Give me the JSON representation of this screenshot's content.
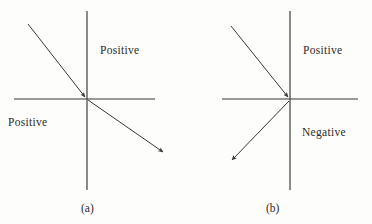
{
  "figure": {
    "type": "diagram",
    "background_color": "#fdfdfc",
    "line_color": "#3a3734",
    "text_color": "#2e2b29"
  },
  "panels": [
    {
      "id": "a",
      "caption": "(a)",
      "origin": {
        "x": 87,
        "y": 99
      },
      "axes": {
        "horizontal": {
          "x1": 14,
          "y1": 99,
          "x2": 155,
          "y2": 99
        },
        "vertical": {
          "x1": 87,
          "y1": 11,
          "x2": 87,
          "y2": 190
        }
      },
      "rays": [
        {
          "name": "incident-ray",
          "from": {
            "x": 28,
            "y": 24
          },
          "to": {
            "x": 85,
            "y": 97
          },
          "arrowhead_at": "end",
          "quadrant_start": "upper-left",
          "quadrant_end": "origin"
        },
        {
          "name": "outgoing-ray",
          "from": {
            "x": 88,
            "y": 100
          },
          "to": {
            "x": 163,
            "y": 152
          },
          "arrowhead_at": "end",
          "quadrant_start": "origin",
          "quadrant_end": "lower-right"
        }
      ],
      "labels": [
        {
          "name": "label-upper-right",
          "text": "Positive",
          "position": "upper-right-quadrant"
        },
        {
          "name": "label-lower-left",
          "text": "Positive",
          "position": "lower-left-quadrant"
        }
      ]
    },
    {
      "id": "b",
      "caption": "(b)",
      "origin": {
        "x": 290,
        "y": 99
      },
      "axes": {
        "horizontal": {
          "x1": 222,
          "y1": 99,
          "x2": 358,
          "y2": 99
        },
        "vertical": {
          "x1": 290,
          "y1": 11,
          "x2": 290,
          "y2": 190
        }
      },
      "rays": [
        {
          "name": "incident-ray",
          "from": {
            "x": 231,
            "y": 26
          },
          "to": {
            "x": 288,
            "y": 97
          },
          "arrowhead_at": "end",
          "quadrant_start": "upper-left",
          "quadrant_end": "origin"
        },
        {
          "name": "outgoing-ray",
          "from": {
            "x": 289,
            "y": 101
          },
          "to": {
            "x": 232,
            "y": 160
          },
          "arrowhead_at": "end",
          "quadrant_start": "origin",
          "quadrant_end": "lower-left"
        }
      ],
      "labels": [
        {
          "name": "label-upper-right",
          "text": "Positive",
          "position": "upper-right-quadrant"
        },
        {
          "name": "label-lower-right",
          "text": "Negative",
          "position": "lower-right-quadrant"
        }
      ]
    }
  ]
}
